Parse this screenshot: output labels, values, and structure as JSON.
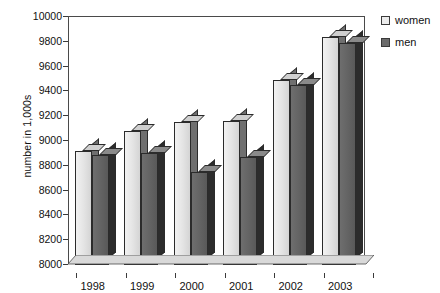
{
  "chart_data": {
    "type": "bar",
    "title": "",
    "subtitle": "",
    "xlabel": "",
    "ylabel": "number in 1,000s",
    "categories": [
      "1998",
      "1999",
      "2000",
      "2001",
      "2002",
      "2003"
    ],
    "series": [
      {
        "name": "women",
        "color": "#ececec",
        "values": [
          8920,
          9080,
          9150,
          9160,
          9490,
          9840
        ]
      },
      {
        "name": "men",
        "color": "#6b6b6b",
        "values": [
          8890,
          8900,
          8750,
          8870,
          9450,
          9790
        ]
      }
    ],
    "ylim": [
      8000,
      10000
    ],
    "ytick_values": [
      8000,
      8200,
      8400,
      8600,
      8800,
      9000,
      9200,
      9400,
      9600,
      9800,
      10000
    ],
    "ytick_labels": [
      "8000",
      "8200",
      "8400",
      "8600",
      "8800",
      "9000",
      "9200",
      "9400",
      "9600",
      "9800",
      "10000"
    ],
    "grid": false,
    "legend_position": "top-right",
    "style": "3d-bars"
  },
  "legend": {
    "items": [
      {
        "label": "women",
        "swatch": "light-gray-square"
      },
      {
        "label": "men",
        "swatch": "dark-gray-square"
      }
    ]
  },
  "axes": {
    "y_title": "number in 1,000s"
  }
}
